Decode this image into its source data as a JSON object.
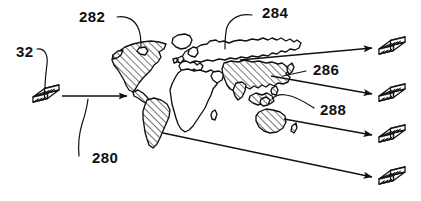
{
  "figure": {
    "background_color": "#ffffff",
    "ink_color": "#111111",
    "style": "patent line drawing, black and white, diagonal hatching"
  },
  "reference_numerals": [
    {
      "id": "32",
      "label": "32",
      "x": 16,
      "y": 57,
      "describes": "source storage module",
      "leader": "curved line from label down-right to source module icon"
    },
    {
      "id": "280",
      "label": "280",
      "x": 92,
      "y": 163,
      "describes": "distribution flow arrow",
      "leader": "curved line from label up-right to the horizontal transfer arrow"
    },
    {
      "id": "282",
      "label": "282",
      "x": 79,
      "y": 22,
      "describes": "Americas region (hatched)",
      "leader": "curved line from label down-right to North America"
    },
    {
      "id": "284",
      "label": "284",
      "x": 262,
      "y": 18,
      "describes": "Northern Eurasia / Russia region (unhatched)",
      "leader": "curved line from label down-left to northern Eurasia"
    },
    {
      "id": "286",
      "label": "286",
      "x": 313,
      "y": 75,
      "describes": "Asia region (hatched)",
      "leader": "straight line from label left to Asia landmass"
    },
    {
      "id": "288",
      "label": "288",
      "x": 320,
      "y": 115,
      "describes": "Australia / Oceania region (hatched)",
      "leader": "curved line from label left to the Oceania islands"
    }
  ],
  "map": {
    "name": "world-map",
    "regions": [
      {
        "name": "north-america",
        "ref": "282",
        "hatched": true
      },
      {
        "name": "south-america",
        "ref": "282",
        "hatched": true
      },
      {
        "name": "greenland",
        "ref": "",
        "hatched": false
      },
      {
        "name": "europe",
        "ref": "",
        "hatched": false
      },
      {
        "name": "africa",
        "ref": "",
        "hatched": false
      },
      {
        "name": "northern-eurasia",
        "ref": "284",
        "hatched": false
      },
      {
        "name": "asia",
        "ref": "286",
        "hatched": true
      },
      {
        "name": "southeast-asia-islands",
        "ref": "288",
        "hatched": true
      },
      {
        "name": "australia",
        "ref": "288",
        "hatched": true
      },
      {
        "name": "new-zealand",
        "ref": "288",
        "hatched": true
      }
    ]
  },
  "modules": {
    "icon_name": "storage-module-icon",
    "description": "hatched slab / stacked media module drawn in oblique view",
    "source": {
      "name": "source-module",
      "ref": "32",
      "x": 46,
      "y": 96
    },
    "destinations": [
      {
        "name": "destination-module-1",
        "x": 392,
        "y": 48
      },
      {
        "name": "destination-module-2",
        "x": 392,
        "y": 95
      },
      {
        "name": "destination-module-3",
        "x": 392,
        "y": 136
      },
      {
        "name": "destination-module-4",
        "x": 392,
        "y": 178
      }
    ]
  },
  "flows": [
    {
      "name": "input-flow-arrow",
      "ref": "280",
      "from": "source-module",
      "to": "north-america",
      "direction": "right"
    },
    {
      "name": "output-flow-arrow-1",
      "from": "northern-eurasia",
      "to": "destination-module-1",
      "direction": "right"
    },
    {
      "name": "output-flow-arrow-2",
      "from": "asia",
      "to": "destination-module-2",
      "direction": "right"
    },
    {
      "name": "output-flow-arrow-3",
      "from": "australia",
      "to": "destination-module-3",
      "direction": "right"
    },
    {
      "name": "output-flow-arrow-4",
      "from": "south-america",
      "to": "destination-module-4",
      "direction": "right"
    }
  ]
}
